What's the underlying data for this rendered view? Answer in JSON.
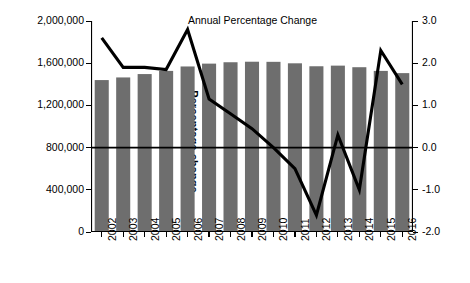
{
  "chart_data": {
    "type": "bar",
    "title": "",
    "series_label": "Annual Percentage Change",
    "categories": [
      "2002",
      "2003",
      "2004",
      "2005",
      "2006",
      "2007",
      "2008",
      "2009",
      "2010",
      "2011",
      "2012",
      "2013",
      "2014",
      "2015",
      "2016"
    ],
    "series": [
      {
        "name": "Number of prisoners",
        "type": "bar",
        "axis": "left",
        "color": "#6e6e6e",
        "values": [
          1440000,
          1465000,
          1497000,
          1527000,
          1569000,
          1596000,
          1609000,
          1614000,
          1613000,
          1599000,
          1571000,
          1577000,
          1562000,
          1527000,
          1506000
        ]
      },
      {
        "name": "Annual Percentage Change",
        "type": "line",
        "axis": "right",
        "color": "#000000",
        "values": [
          2.6,
          1.9,
          1.9,
          1.85,
          2.8,
          1.15,
          0.8,
          0.45,
          0.0,
          -0.5,
          -1.6,
          0.3,
          -1.0,
          2.3,
          1.5
        ]
      }
    ],
    "xlabel": "",
    "ylabel_left": "Number of prisoners",
    "ylabel_right": "Percentage change",
    "ylim_left": [
      0,
      2000000
    ],
    "ylim_right": [
      -2.0,
      3.0
    ],
    "yticks_left": [
      "0",
      "400,000",
      "800,000",
      "1,200,000",
      "1,600,000",
      "2,000,000"
    ],
    "yticks_left_values": [
      0,
      400000,
      800000,
      1200000,
      1600000,
      2000000
    ],
    "yticks_right": [
      "-2.0",
      "-1.0",
      "0.0",
      "1.0",
      "2.0",
      "3.0"
    ],
    "yticks_right_values": [
      -2.0,
      -1.0,
      0.0,
      1.0,
      2.0,
      3.0
    ],
    "grid": false,
    "legend_position": "inline-annotation",
    "zero_line": true
  }
}
